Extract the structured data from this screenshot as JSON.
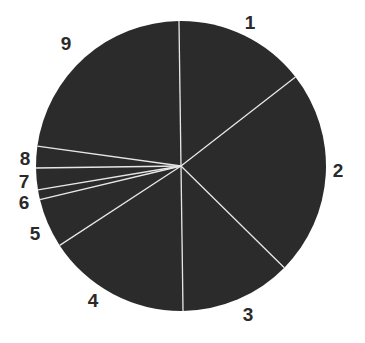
{
  "chart_data": {
    "type": "pie",
    "title": "",
    "start_angle_deg": -0.8,
    "direction": "clockwise",
    "categories": [
      "1",
      "2",
      "3",
      "4",
      "5",
      "6",
      "7",
      "8",
      "9"
    ],
    "values": [
      14.7,
      22.9,
      12.4,
      16.0,
      5.5,
      1.1,
      2.4,
      2.4,
      22.6
    ],
    "slice_color": "#2b2b2b",
    "separator_color": "#e6e6e6",
    "labels": [
      {
        "text": "1",
        "x": 250,
        "y": 29
      },
      {
        "text": "2",
        "x": 338,
        "y": 177
      },
      {
        "text": "3",
        "x": 248,
        "y": 321
      },
      {
        "text": "4",
        "x": 93,
        "y": 307
      },
      {
        "text": "5",
        "x": 35,
        "y": 240
      },
      {
        "text": "6",
        "x": 24,
        "y": 209
      },
      {
        "text": "7",
        "x": 24,
        "y": 188
      },
      {
        "text": "8",
        "x": 25,
        "y": 165
      },
      {
        "text": "9",
        "x": 66,
        "y": 50
      }
    ],
    "legend": "none",
    "grid": false
  },
  "geometry": {
    "cx": 181,
    "cy": 166,
    "r": 145
  }
}
